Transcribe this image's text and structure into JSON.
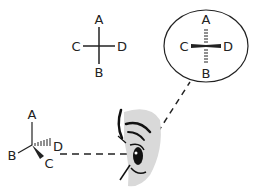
{
  "diagram": {
    "title": "",
    "fischer_projection": {
      "top": "A",
      "left": "C",
      "right": "D",
      "bottom": "B"
    },
    "magnified_view": {
      "top": "A",
      "left": "C",
      "right": "D",
      "bottom": "B"
    },
    "wedge_dash_structure": {
      "top": "A",
      "left": "B",
      "wedge": "C",
      "dash": "D"
    },
    "colors": {
      "stroke": "#222222",
      "eye_shade": "#d9d9d9",
      "background": "#ffffff"
    }
  }
}
